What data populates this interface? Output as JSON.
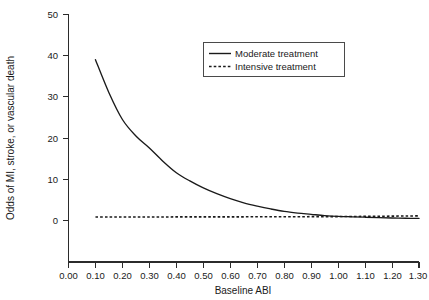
{
  "chart_data": {
    "type": "line",
    "title": "",
    "subtitle": "",
    "xlabel": "Baseline ABI",
    "ylabel": "Odds of MI, stroke, or vascular death",
    "xlim": [
      0.0,
      1.3
    ],
    "ylim": [
      0,
      50
    ],
    "grid": false,
    "legend_position": "top-center",
    "xticks": [
      "0.00",
      "0.10",
      "0.20",
      "0.30",
      "0.40",
      "0.50",
      "0.60",
      "0.70",
      "0.80",
      "0.90",
      "1.00",
      "1.10",
      "1.20",
      "1.30"
    ],
    "xtick_values": [
      0.0,
      0.1,
      0.2,
      0.3,
      0.4,
      0.5,
      0.6,
      0.7,
      0.8,
      0.9,
      1.0,
      1.1,
      1.2,
      1.3
    ],
    "yticks": [
      "0",
      "10",
      "20",
      "30",
      "40",
      "50"
    ],
    "ytick_values": [
      0,
      10,
      20,
      30,
      40,
      50
    ],
    "x": [
      0.1,
      0.15,
      0.2,
      0.25,
      0.3,
      0.35,
      0.4,
      0.45,
      0.5,
      0.55,
      0.6,
      0.65,
      0.7,
      0.75,
      0.8,
      0.85,
      0.9,
      0.95,
      1.0,
      1.05,
      1.1,
      1.15,
      1.2,
      1.25,
      1.3
    ],
    "series": [
      {
        "name": "Moderate treatment",
        "style": "solid",
        "color": "#1a1a1a",
        "values": [
          39.0,
          31.0,
          24.5,
          20.5,
          17.6,
          14.4,
          11.6,
          9.6,
          7.9,
          6.5,
          5.3,
          4.3,
          3.5,
          2.8,
          2.2,
          1.8,
          1.5,
          1.2,
          1.0,
          0.9,
          0.8,
          0.7,
          0.6,
          0.55,
          0.5
        ]
      },
      {
        "name": "Intensive treatment",
        "style": "dotted",
        "color": "#1a1a1a",
        "values": [
          0.85,
          0.85,
          0.85,
          0.86,
          0.86,
          0.86,
          0.87,
          0.87,
          0.88,
          0.88,
          0.89,
          0.89,
          0.9,
          0.9,
          0.91,
          0.92,
          0.93,
          0.94,
          0.95,
          0.97,
          1.0,
          1.03,
          1.06,
          1.09,
          1.12
        ]
      }
    ],
    "annotations": []
  },
  "legend": {
    "entries": [
      {
        "label": "Moderate treatment",
        "style": "solid"
      },
      {
        "label": "Intensive treatment",
        "style": "dotted"
      }
    ]
  }
}
